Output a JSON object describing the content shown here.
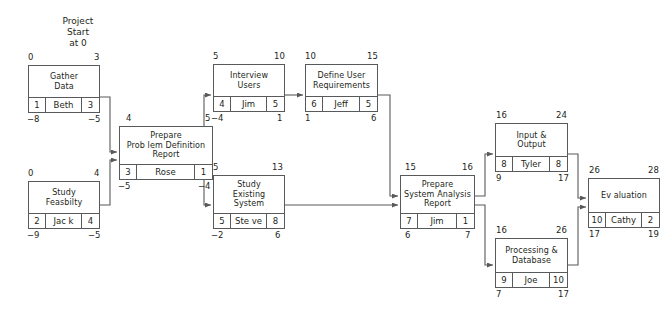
{
  "diagram": {
    "type": "project-network-schedule",
    "start_note": "Project\nStart\nat 0",
    "colors": {
      "line": "#58595b",
      "text": "#231f20",
      "background": "#ffffff"
    },
    "nodes": [
      {
        "id": "gather-data",
        "title": "Gather\nData",
        "early_start": "0",
        "early_finish": "3",
        "duration": "1",
        "resource": "Beth",
        "slack_or_float": "3",
        "late_start": "−8",
        "late_finish": "−5"
      },
      {
        "id": "study-feasibility",
        "title": "Study\nFeasbilty",
        "early_start": "0",
        "early_finish": "4",
        "duration": "2",
        "resource": "Jac k",
        "slack_or_float": "4",
        "late_start": "−9",
        "late_finish": "−5"
      },
      {
        "id": "prepare-problem-definition-report",
        "title": "Prepare\nProb lem Definition\nReport",
        "early_start": "4",
        "early_finish": "5",
        "duration": "3",
        "resource": "Rose",
        "slack_or_float": "1",
        "late_start": "−5",
        "late_finish": "−4"
      },
      {
        "id": "interview-users",
        "title": "Interview\nUsers",
        "early_start": "5",
        "early_finish": "10",
        "duration": "4",
        "resource": "Jim",
        "slack_or_float": "5",
        "late_start": "−4",
        "late_finish": "1"
      },
      {
        "id": "define-user-requirements",
        "title": "Define User\nRequirements",
        "early_start": "10",
        "early_finish": "15",
        "duration": "6",
        "resource": "Jeff",
        "slack_or_float": "5",
        "late_start": "1",
        "late_finish": "6"
      },
      {
        "id": "study-existing-system",
        "title": "Study\nExisting\nSystem",
        "early_start": "5",
        "early_finish": "13",
        "duration": "5",
        "resource": "Ste ve",
        "slack_or_float": "8",
        "late_start": "−2",
        "late_finish": "6"
      },
      {
        "id": "prepare-system-analysis-report",
        "title": "Prepare\nSystem Analysis\nReport",
        "early_start": "15",
        "early_finish": "16",
        "duration": "7",
        "resource": "Jim",
        "slack_or_float": "1",
        "late_start": "6",
        "late_finish": "7"
      },
      {
        "id": "input-and-output",
        "title": "Input &\nOutput",
        "early_start": "16",
        "early_finish": "24",
        "duration": "8",
        "resource": "Tyler",
        "slack_or_float": "8",
        "late_start": "9",
        "late_finish": "17"
      },
      {
        "id": "processing-and-database",
        "title": "Processing &\nDatabase",
        "early_start": "16",
        "early_finish": "26",
        "duration": "9",
        "resource": "Joe",
        "slack_or_float": "10",
        "late_start": "7",
        "late_finish": "17"
      },
      {
        "id": "evaluation",
        "title": "Ev aluation",
        "early_start": "26",
        "early_finish": "28",
        "duration": "10",
        "resource": "Cathy",
        "slack_or_float": "2",
        "late_start": "17",
        "late_finish": "19"
      }
    ],
    "edges": [
      {
        "from": "gather-data",
        "to": "prepare-problem-definition-report"
      },
      {
        "from": "study-feasibility",
        "to": "prepare-problem-definition-report"
      },
      {
        "from": "prepare-problem-definition-report",
        "to": "interview-users"
      },
      {
        "from": "prepare-problem-definition-report",
        "to": "study-existing-system"
      },
      {
        "from": "interview-users",
        "to": "define-user-requirements"
      },
      {
        "from": "define-user-requirements",
        "to": "prepare-system-analysis-report"
      },
      {
        "from": "study-existing-system",
        "to": "prepare-system-analysis-report"
      },
      {
        "from": "prepare-system-analysis-report",
        "to": "input-and-output"
      },
      {
        "from": "prepare-system-analysis-report",
        "to": "processing-and-database"
      },
      {
        "from": "input-and-output",
        "to": "evaluation"
      },
      {
        "from": "processing-and-database",
        "to": "evaluation"
      }
    ]
  }
}
